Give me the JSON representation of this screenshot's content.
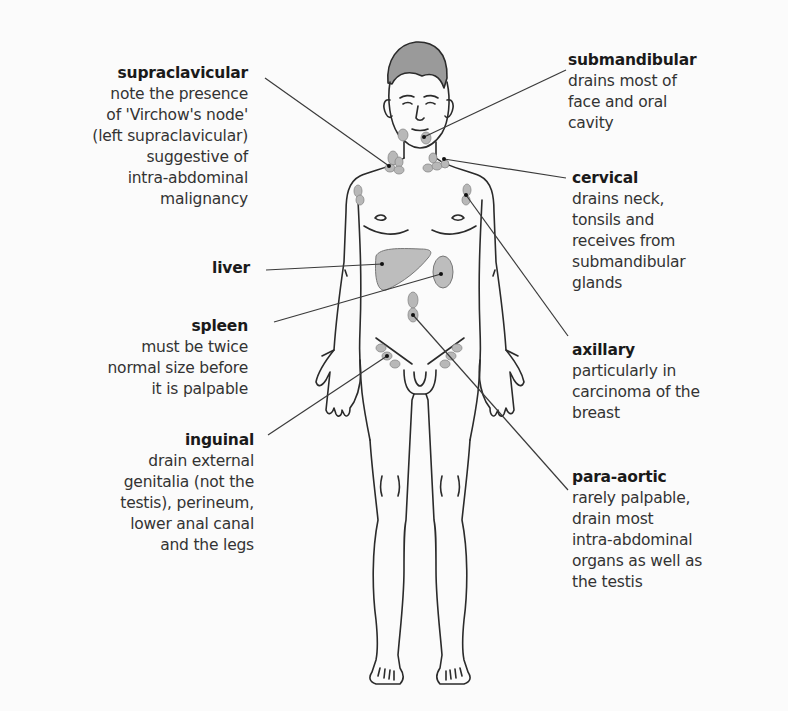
{
  "diagram": {
    "colors": {
      "background": "#fbfbfb",
      "outline": "#2b2b2b",
      "node_fill": "#b8b8b8",
      "organ_fill": "#bdbdbd",
      "leader_line": "#3a3a3a"
    },
    "labels": {
      "supraclavicular": {
        "title": "supraclavicular",
        "desc": "note the presence\nof 'Virchow's node'\n(left supraclavicular)\nsuggestive of\nintra-abdominal\nmalignancy"
      },
      "liver": {
        "title": "liver",
        "desc": ""
      },
      "spleen": {
        "title": "spleen",
        "desc": "must be twice\nnormal size before\nit is palpable"
      },
      "inguinal": {
        "title": "inguinal",
        "desc": "drain external\ngenitalia (not the\ntestis), perineum,\nlower anal canal\nand the legs"
      },
      "submandibular": {
        "title": "submandibular",
        "desc": "drains most of\nface and oral\ncavity"
      },
      "cervical": {
        "title": "cervical",
        "desc": "drains neck,\ntonsils and\nreceives from\nsubmandibular\nglands"
      },
      "axillary": {
        "title": "axillary",
        "desc": "particularly in\ncarcinoma of the\nbreast"
      },
      "para_aortic": {
        "title": "para-aortic",
        "desc": "rarely palpable,\ndrain most\nintra-abdominal\norgans as well as\nthe testis"
      }
    }
  }
}
